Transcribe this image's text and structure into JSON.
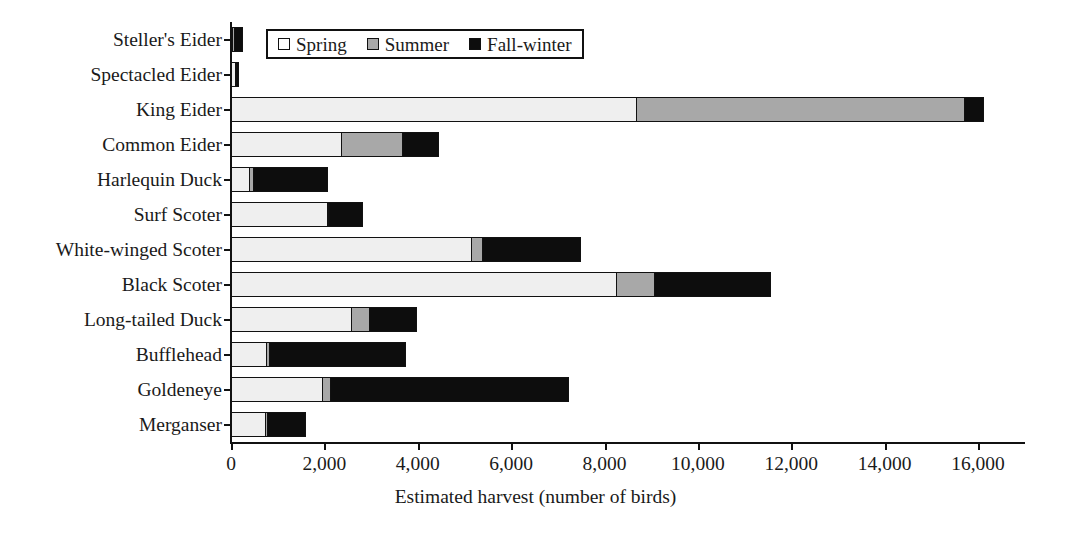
{
  "chart_data": {
    "type": "bar",
    "orientation": "horizontal",
    "stacked": true,
    "title": "",
    "xlabel": "Estimated harvest (number of birds)",
    "ylabel": "",
    "xlim": [
      0,
      17000
    ],
    "xticks": [
      0,
      2000,
      4000,
      6000,
      8000,
      10000,
      12000,
      14000,
      16000
    ],
    "xtick_labels": [
      "0",
      "2,000",
      "4,000",
      "6,000",
      "8,000",
      "10,000",
      "12,000",
      "14,000",
      "16,000"
    ],
    "grid": false,
    "legend_position": "top-center",
    "categories": [
      "Steller's Eider",
      "Spectacled Eider",
      "King Eider",
      "Common Eider",
      "Harlequin Duck",
      "Surf Scoter",
      "White-winged Scoter",
      "Black Scoter",
      "Long-tailed Duck",
      "Bufflehead",
      "Goldeneye",
      "Merganser"
    ],
    "series": [
      {
        "name": "Spring",
        "color": "#efefef",
        "values": [
          40,
          110,
          8715,
          2380,
          430,
          2080,
          5180,
          8270,
          2610,
          790,
          1990,
          770
        ]
      },
      {
        "name": "Summer",
        "color": "#a8a8a8",
        "values": [
          20,
          20,
          7045,
          1345,
          110,
          40,
          260,
          860,
          410,
          90,
          200,
          30
        ]
      },
      {
        "name": "Fall-winter",
        "color": "#0d0d0d",
        "values": [
          190,
          10,
          430,
          795,
          1600,
          750,
          2120,
          2510,
          1030,
          2930,
          5110,
          850
        ]
      }
    ],
    "totals": [
      250,
      140,
      16190,
      4520,
      2140,
      2870,
      7560,
      11640,
      4050,
      3810,
      7300,
      1650
    ]
  },
  "legend": {
    "items": [
      {
        "label": "Spring",
        "swatch": "legend-swatch-spring"
      },
      {
        "label": "Summer",
        "swatch": "legend-swatch-summer"
      },
      {
        "label": "Fall-winter",
        "swatch": "legend-swatch-fall-winter"
      }
    ]
  },
  "colors": {
    "spring": "#efefef",
    "summer": "#a8a8a8",
    "fall_winter": "#0d0d0d",
    "axis": "#111111",
    "background": "#ffffff"
  }
}
